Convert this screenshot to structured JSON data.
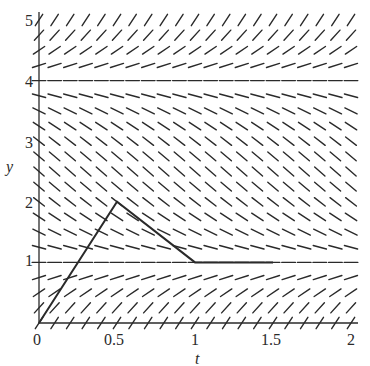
{
  "chart_data": {
    "type": "line",
    "subtype": "slope-field-with-euler-approximation",
    "title": "",
    "xlabel": "t",
    "ylabel": "y",
    "xlim": [
      0,
      2
    ],
    "ylim": [
      0,
      5
    ],
    "x_ticks": [
      0,
      0.5,
      1,
      1.5,
      2
    ],
    "x_tick_labels": [
      "0",
      "0.5",
      "1",
      "1.5",
      "2"
    ],
    "y_ticks": [
      1,
      2,
      3,
      4,
      5
    ],
    "y_tick_labels": [
      "1",
      "2",
      "3",
      "4",
      "5"
    ],
    "grid": false,
    "legend": null,
    "slope_field": {
      "equation": "dy/dt = (1 - y)(4 - y)",
      "t_step": 0.1,
      "y_step": 0.25,
      "equilibria": [
        1,
        4
      ]
    },
    "series": [
      {
        "name": "Euler approximation",
        "x": [
          0,
          0.5,
          1,
          1.5
        ],
        "y": [
          0,
          2,
          1,
          1
        ]
      }
    ]
  },
  "colors": {
    "ink": "#2a2a2a",
    "background": "#ffffff"
  }
}
